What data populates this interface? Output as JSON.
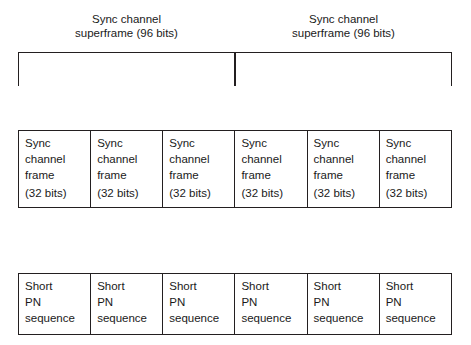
{
  "diagram": {
    "superframes": [
      {
        "line1": "Sync channel",
        "line2": "superframe (96 bits)"
      },
      {
        "line1": "Sync channel",
        "line2": "superframe (96 bits)"
      }
    ],
    "frames": [
      {
        "line1": "Sync",
        "line2": "channel",
        "line3": "frame",
        "line4": "(32 bits)"
      },
      {
        "line1": "Sync",
        "line2": "channel",
        "line3": "frame",
        "line4": "(32 bits)"
      },
      {
        "line1": "Sync",
        "line2": "channel",
        "line3": "frame",
        "line4": "(32 bits)"
      },
      {
        "line1": "Sync",
        "line2": "channel",
        "line3": "frame",
        "line4": "(32 bits)"
      },
      {
        "line1": "Sync",
        "line2": "channel",
        "line3": "frame",
        "line4": "(32 bits)"
      },
      {
        "line1": "Sync",
        "line2": "channel",
        "line3": "frame",
        "line4": "(32 bits)"
      }
    ],
    "pn_sequences": [
      {
        "line1": "Short",
        "line2": "PN",
        "line3": "sequence"
      },
      {
        "line1": "Short",
        "line2": "PN",
        "line3": "sequence"
      },
      {
        "line1": "Short",
        "line2": "PN",
        "line3": "sequence"
      },
      {
        "line1": "Short",
        "line2": "PN",
        "line3": "sequence"
      },
      {
        "line1": "Short",
        "line2": "PN",
        "line3": "sequence"
      },
      {
        "line1": "Short",
        "line2": "PN",
        "line3": "sequence"
      }
    ],
    "colors": {
      "stroke": "#231f20",
      "text": "#1a1a1a",
      "background": "#ffffff"
    }
  }
}
